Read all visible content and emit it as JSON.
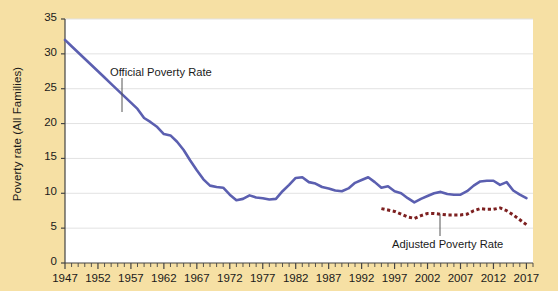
{
  "chart_data": {
    "type": "line",
    "title": "",
    "xlabel": "",
    "ylabel": "Poverty rate (All Families)",
    "xlim": [
      1947,
      2018
    ],
    "ylim": [
      0,
      35
    ],
    "yticks": [
      0,
      5,
      10,
      15,
      20,
      25,
      30,
      35
    ],
    "xticks": [
      1947,
      1952,
      1957,
      1962,
      1967,
      1972,
      1977,
      1982,
      1987,
      1992,
      1997,
      2002,
      2007,
      2012,
      2017
    ],
    "xtick_labels": [
      "1947",
      "1952",
      "1957",
      "1962",
      "1967",
      "1972",
      "1977",
      "1982",
      "1987",
      "1992",
      "1997",
      "2002",
      "2007",
      "2012",
      "2017"
    ],
    "ytick_labels": [
      "0",
      "5",
      "10",
      "15",
      "20",
      "25",
      "30",
      "35"
    ],
    "minor_xtick_interval": 1,
    "grid": "horizontal",
    "legend": "none",
    "plot_bgcolor": "#ffffff",
    "figure_bgcolor": "#f6e0a4",
    "series": [
      {
        "name": "Official Poverty Rate",
        "color": "#5b5fb0",
        "style": "solid",
        "x": [
          1947,
          1948,
          1949,
          1950,
          1951,
          1952,
          1953,
          1954,
          1955,
          1956,
          1957,
          1958,
          1959,
          1960,
          1961,
          1962,
          1963,
          1964,
          1965,
          1966,
          1967,
          1968,
          1969,
          1970,
          1971,
          1972,
          1973,
          1974,
          1975,
          1976,
          1977,
          1978,
          1979,
          1980,
          1981,
          1982,
          1983,
          1984,
          1985,
          1986,
          1987,
          1988,
          1989,
          1990,
          1991,
          1992,
          1993,
          1994,
          1995,
          1996,
          1997,
          1998,
          1999,
          2000,
          2001,
          2002,
          2003,
          2004,
          2005,
          2006,
          2007,
          2008,
          2009,
          2010,
          2011,
          2012,
          2013,
          2014,
          2015,
          2016,
          2017
        ],
        "values": [
          32.0,
          31.1,
          30.2,
          29.3,
          28.4,
          27.5,
          26.6,
          25.7,
          24.8,
          23.9,
          23.0,
          22.1,
          20.8,
          20.2,
          19.5,
          18.5,
          18.3,
          17.4,
          16.2,
          14.7,
          13.3,
          12.0,
          11.1,
          10.9,
          10.8,
          9.8,
          9.0,
          9.2,
          9.7,
          9.4,
          9.3,
          9.1,
          9.2,
          10.3,
          11.2,
          12.2,
          12.3,
          11.6,
          11.4,
          10.9,
          10.7,
          10.4,
          10.3,
          10.7,
          11.5,
          11.9,
          12.3,
          11.6,
          10.8,
          11.0,
          10.3,
          10.0,
          9.3,
          8.7,
          9.2,
          9.6,
          10.0,
          10.2,
          9.9,
          9.8,
          9.8,
          10.3,
          11.1,
          11.7,
          11.8,
          11.8,
          11.2,
          11.6,
          10.4,
          9.8,
          9.3
        ]
      },
      {
        "name": "Adjusted Poverty Rate",
        "color": "#7d2020",
        "style": "dashed",
        "x": [
          1995,
          1996,
          1997,
          1998,
          1999,
          2000,
          2001,
          2002,
          2003,
          2004,
          2005,
          2006,
          2007,
          2008,
          2009,
          2010,
          2011,
          2012,
          2013,
          2014,
          2015,
          2016,
          2017
        ],
        "values": [
          7.8,
          7.6,
          7.4,
          7.0,
          6.6,
          6.4,
          6.8,
          7.1,
          7.1,
          7.0,
          6.9,
          6.9,
          6.9,
          7.0,
          7.5,
          7.8,
          7.7,
          7.7,
          7.9,
          7.5,
          6.9,
          6.2,
          5.5
        ]
      }
    ],
    "annotations": [
      {
        "text": "Official Poverty Rate",
        "series": "Official Poverty Rate",
        "label_x_px": 110,
        "label_y_px": 66,
        "leader_from_px": [
          122,
          78
        ],
        "leader_to_px": [
          122,
          112
        ]
      },
      {
        "text": "Adjusted Poverty Rate",
        "series": "Adjusted Poverty Rate",
        "label_x_px": 392,
        "label_y_px": 238,
        "leader_from_px": [
          440,
          236
        ],
        "leader_to_px": [
          440,
          214
        ]
      }
    ]
  }
}
